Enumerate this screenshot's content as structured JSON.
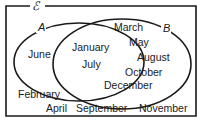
{
  "diagram": {
    "type": "venn",
    "universal_label": "ℰ",
    "sets": [
      {
        "name": "A",
        "label": "A"
      },
      {
        "name": "B",
        "label": "B"
      }
    ],
    "regions": {
      "A_only": [
        "June"
      ],
      "A_and_B": [
        "January",
        "July"
      ],
      "B_only": [
        "March",
        "May",
        "August",
        "October",
        "December"
      ],
      "outside": [
        "February",
        "April",
        "September",
        "November"
      ]
    },
    "colors": {
      "line": "#1a1a1a",
      "background": "#ffffff"
    }
  }
}
